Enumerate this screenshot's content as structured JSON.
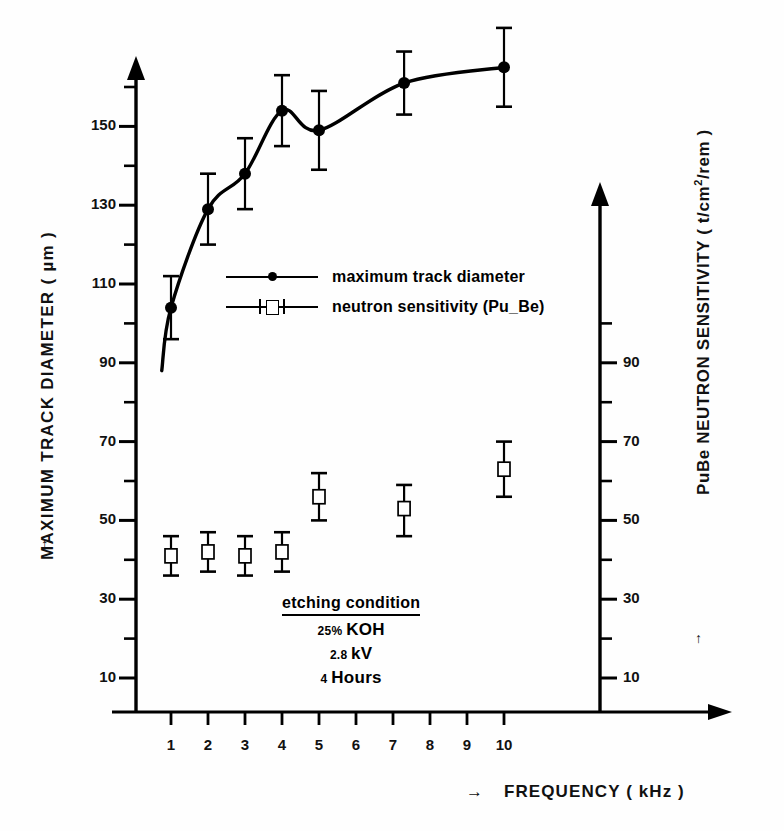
{
  "chart_data": {
    "type": "scatter",
    "title": "",
    "xlabel": "FREQUENCY ( kHz )",
    "xlabel_arrow": "→",
    "x": [
      1,
      2,
      3,
      4,
      5,
      7.3,
      10
    ],
    "xtick_labels": [
      "1",
      "2",
      "3",
      "4",
      "5",
      "6",
      "7",
      "8",
      "9",
      "10"
    ],
    "xtick_values": [
      1,
      2,
      3,
      4,
      5,
      6,
      7,
      8,
      9,
      10
    ],
    "xlim": [
      0.45,
      11.6
    ],
    "grid": false,
    "legend_position": "center-upper",
    "axes": [
      {
        "id": "left",
        "label": "MAXIMUM TRACK DIAMETER ( µm )",
        "arrow": "↑",
        "tick_labels": [
          "10",
          "30",
          "50",
          "70",
          "90",
          "110",
          "130",
          "150"
        ],
        "tick_values": [
          10,
          30,
          50,
          70,
          90,
          110,
          130,
          150
        ],
        "minor_tick_values": [
          20,
          40,
          60,
          80,
          100,
          120,
          140,
          160
        ],
        "ylim": [
          0,
          172
        ]
      },
      {
        "id": "right",
        "label": "PuBe NEUTRON SENSITIVITY ( t/cm²/rem )",
        "label_main": "PuBe NEUTRON SENSITIVITY ( t/cm",
        "label_sup": "2",
        "label_tail": "/rem )",
        "arrow": "↑",
        "tick_labels": [
          "10",
          "30",
          "50",
          "70",
          "90"
        ],
        "tick_values": [
          10,
          30,
          50,
          70,
          90
        ],
        "minor_tick_values": [
          20,
          40,
          60,
          80,
          100
        ],
        "ylim": [
          0,
          172
        ]
      }
    ],
    "series": [
      {
        "name": "maximum track diameter",
        "axis": "left",
        "marker": "filled-circle",
        "curve": true,
        "values": [
          104,
          129,
          138,
          154,
          149,
          161,
          165
        ],
        "err_low": [
          8,
          9,
          9,
          9,
          10,
          8,
          10
        ],
        "err_high": [
          8,
          9,
          9,
          9,
          10,
          8,
          10
        ]
      },
      {
        "name": "neutron sensitivity (Pu_Be)",
        "axis": "right",
        "marker": "open-square",
        "curve": false,
        "values": [
          41,
          42,
          41,
          42,
          56,
          53,
          63
        ],
        "err_low": [
          5,
          5,
          5,
          5,
          6,
          7,
          7
        ],
        "err_high": [
          5,
          5,
          5,
          5,
          6,
          6,
          7
        ]
      }
    ]
  },
  "legend": {
    "items": [
      {
        "label": "maximum track diameter",
        "marker": "filled-circle"
      },
      {
        "label": "neutron sensitivity (Pu_Be)",
        "marker": "open-square"
      }
    ]
  },
  "annotation": {
    "title": "etching condition",
    "lines": [
      {
        "value": "25",
        "unit": "%",
        "text": "KOH"
      },
      {
        "value": "2.8",
        "unit": "",
        "text": "kV"
      },
      {
        "value": "4",
        "unit": "",
        "text": "Hours"
      }
    ]
  },
  "colors": {
    "ink": "#000000",
    "background": "#ffffff"
  }
}
